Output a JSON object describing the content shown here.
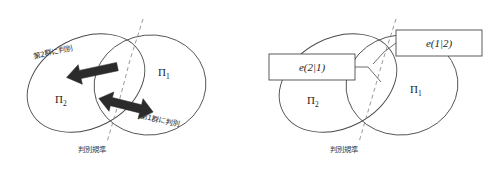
{
  "figure": {
    "background_color": "#ffffff",
    "outline_color": "#4a4a4a",
    "dashed_color": "#8d8d8d",
    "arrow_color": "#2b2b2b",
    "panels": [
      {
        "id": "left",
        "name": "discrimination-rule-panel",
        "regions": [
          {
            "id": "pi2",
            "symbol": "Π",
            "subscript": "2"
          },
          {
            "id": "pi1",
            "symbol": "Π",
            "subscript": "1"
          }
        ],
        "arrows": [
          {
            "id": "assign-to-group-2",
            "direction": "left",
            "label": "第2群に判別"
          },
          {
            "id": "assign-to-group-1",
            "direction": "right",
            "label": "第1群に判別"
          }
        ],
        "boundary": {
          "id": "discriminant-boundary",
          "label": "判別規準",
          "style": "dashed"
        }
      },
      {
        "id": "right",
        "name": "misclassification-probability-panel",
        "regions": [
          {
            "id": "pi2",
            "symbol": "Π",
            "subscript": "2"
          },
          {
            "id": "pi1",
            "symbol": "Π",
            "subscript": "1"
          }
        ],
        "callouts": [
          {
            "id": "error-2-given-1",
            "name": "error-2-given-1-box",
            "label": "e(2|1)"
          },
          {
            "id": "error-1-given-2",
            "name": "error-1-given-2-box",
            "label": "e(1|2)"
          }
        ],
        "boundary": {
          "id": "discriminant-boundary",
          "label": "判別規準",
          "style": "dashed"
        }
      }
    ]
  }
}
